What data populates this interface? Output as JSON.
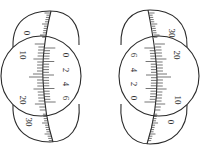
{
  "figures": [
    {
      "id": "left",
      "main_scale_labels": [
        {
          "text": "0",
          "x": 27,
          "y": 33
        },
        {
          "text": "10",
          "x": 23,
          "y": 55
        },
        {
          "text": "20",
          "x": 23,
          "y": 100
        },
        {
          "text": "30",
          "x": 29,
          "y": 122
        }
      ],
      "vernier_labels": [
        {
          "text": "0",
          "x": 66,
          "y": 55
        },
        {
          "text": "2",
          "x": 66,
          "y": 70
        },
        {
          "text": "4",
          "x": 66,
          "y": 84
        },
        {
          "text": "6",
          "x": 66,
          "y": 98
        }
      ]
    },
    {
      "id": "right",
      "main_scale_labels": [
        {
          "text": "30",
          "x": 172,
          "y": 33
        },
        {
          "text": "20",
          "x": 177,
          "y": 55
        },
        {
          "text": "10",
          "x": 178,
          "y": 100
        },
        {
          "text": "0",
          "x": 171,
          "y": 122
        }
      ],
      "vernier_labels": [
        {
          "text": "6",
          "x": 134,
          "y": 55
        },
        {
          "text": "4",
          "x": 134,
          "y": 70
        },
        {
          "text": "2",
          "x": 134,
          "y": 84
        },
        {
          "text": "0",
          "x": 134,
          "y": 98
        }
      ]
    }
  ],
  "colors": {
    "line": "#2b2b2b",
    "background": "#ffffff"
  }
}
